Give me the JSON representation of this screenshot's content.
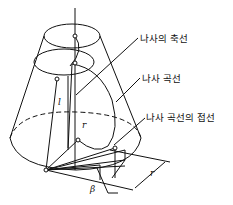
{
  "diagram": {
    "labels": {
      "screw_axis": "나사의 축선",
      "screw_curve": "나사 곡선",
      "tangent": "나사 곡선의 접선"
    },
    "symbols": {
      "length": "l",
      "radius_small": "r",
      "radius_dim": "r",
      "angle": "β"
    },
    "colors": {
      "stroke": "#111111",
      "background": "#ffffff"
    }
  }
}
